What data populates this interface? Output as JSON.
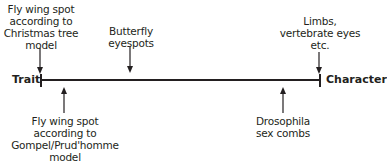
{
  "diagram": {
    "axis": {
      "left_label": "Trait",
      "right_label": "Character",
      "color": "#231f20"
    },
    "top_annotations": [
      {
        "lines": [
          "Fly wing spot",
          "according to",
          "Christmas tree",
          "model"
        ]
      },
      {
        "lines": [
          "Butterfly",
          "eyespots"
        ]
      },
      {
        "lines": [
          "Limbs,",
          "vertebrate eyes",
          "etc."
        ]
      }
    ],
    "bottom_annotations": [
      {
        "lines": [
          "Fly wing spot",
          "according to",
          "Gompel/Prud'homme",
          "model"
        ]
      },
      {
        "lines": [
          "Drosophila",
          "sex combs"
        ]
      }
    ]
  }
}
